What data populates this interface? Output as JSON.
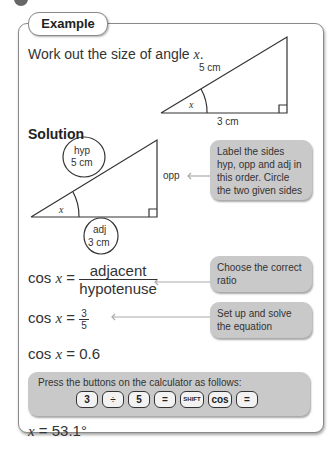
{
  "header": {
    "tab_label": "Example"
  },
  "question": {
    "text": "Work out the size of angle ",
    "variable": "x",
    "end": "."
  },
  "question_triangle": {
    "hyp_label": "5 cm",
    "adj_label": "3 cm",
    "angle_label": "x"
  },
  "solution": {
    "title": "Solution",
    "triangle": {
      "hyp_label_1": "hyp",
      "hyp_label_2": "5 cm",
      "opp_label": "opp",
      "adj_label_1": "adj",
      "adj_label_2": "3 cm",
      "angle_label": "x"
    },
    "callouts": [
      {
        "text": "Label the sides hyp, opp and adj in this order. Circle the two given sides"
      },
      {
        "text": "Choose the correct ratio"
      },
      {
        "text": "Set up and solve the equation"
      }
    ],
    "steps": {
      "step1": {
        "lhs": "cos ",
        "var": "x",
        "eq": " = ",
        "num": "adjacent",
        "den": "hypotenuse"
      },
      "step2": {
        "lhs": "cos ",
        "var": "x",
        "eq": " = ",
        "num": "3",
        "den": "5"
      },
      "step3": {
        "lhs": "cos ",
        "var": "x",
        "rhs": " = 0.6"
      }
    },
    "calculator": {
      "instruction": "Press the buttons on the calculator as follows:",
      "keys": [
        "3",
        "÷",
        "5",
        "=",
        "SHIFT",
        "cos",
        "="
      ]
    },
    "answer": {
      "var": "x",
      "rhs": " = 53.1°"
    }
  }
}
